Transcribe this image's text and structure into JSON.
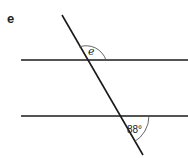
{
  "question_label": "e",
  "diagram": {
    "angles": [
      {
        "label": "e",
        "kind": "unknown",
        "position": "upper intersection, above top line, right of transversal"
      },
      {
        "label": "88°",
        "kind": "given",
        "value_degrees": 88,
        "position": "lower intersection, below bottom line, right of transversal"
      }
    ]
  }
}
